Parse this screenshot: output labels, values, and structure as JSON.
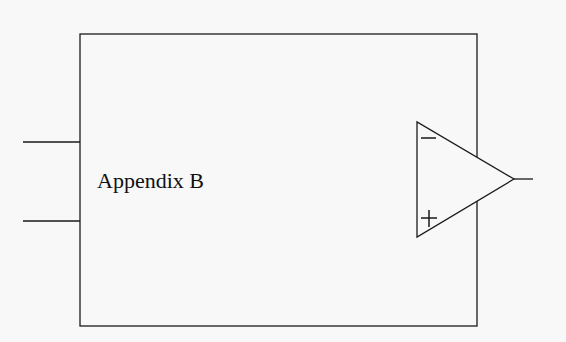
{
  "diagram": {
    "block_label": "Appendix B",
    "opamp": {
      "inverting_symbol": "−",
      "noninverting_symbol": "+"
    },
    "colors": {
      "background": "#f8f8f8",
      "stroke": "#1a1a1a"
    }
  }
}
